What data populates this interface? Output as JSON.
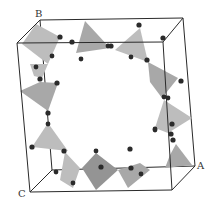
{
  "diagram": {
    "type": "crystal-structure",
    "axis_labels": {
      "a": "A",
      "b": "B",
      "c": "C"
    },
    "colors": {
      "background": "#ffffff",
      "cell_edges": "#2a2a2a",
      "tetrahedron_light": "#bdbdbd",
      "tetrahedron_mid": "#a8a8a8",
      "tetrahedron_dark": "#949494",
      "atoms": "#2b2b2b"
    },
    "tetrahedra_count": 12
  }
}
